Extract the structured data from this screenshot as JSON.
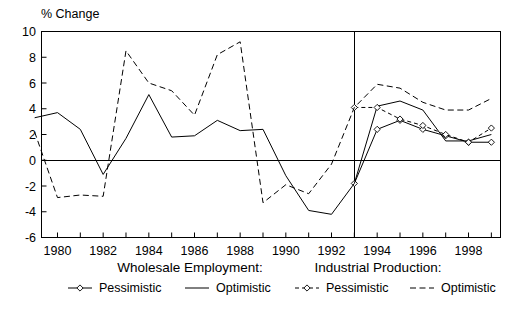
{
  "chart_data": {
    "type": "line",
    "title": "",
    "ylabel": "% Change",
    "xlabel": "",
    "ylim": [
      -6,
      10
    ],
    "xlim": [
      1979.3,
      1999.4
    ],
    "yticks": [
      -6,
      -4,
      -2,
      0,
      2,
      4,
      6,
      8,
      10
    ],
    "xticks": [
      1980,
      1982,
      1984,
      1986,
      1988,
      1990,
      1992,
      1994,
      1996,
      1998
    ],
    "xtick_labels": [
      "1980",
      "1982",
      "1984",
      "1986",
      "1988",
      "1990",
      "1992",
      "1994",
      "1996",
      "1998"
    ],
    "ytick_labels": [
      "-6",
      "-4",
      "-2",
      "0",
      "2",
      "4",
      "6",
      "8",
      "10"
    ],
    "grid": false,
    "zero_line": 0,
    "forecast_divider_x": 1993,
    "legend_position": "below",
    "series": [
      {
        "name": "Wholesale Employment: Pessimistic",
        "group": "Wholesale Employment:",
        "variant": "Pessimistic",
        "style": "solid-with-markers",
        "marker": "diamond",
        "color": "#000000",
        "x": [
          1993,
          1994,
          1995,
          1996,
          1997,
          1998,
          1999
        ],
        "values": [
          -1.8,
          2.4,
          3.1,
          2.4,
          1.9,
          1.4,
          1.4
        ]
      },
      {
        "name": "Wholesale Employment: Optimistic",
        "group": "Wholesale Employment:",
        "variant": "Optimistic",
        "style": "solid",
        "marker": "none",
        "color": "#000000",
        "x": [
          1979,
          1980,
          1981,
          1982,
          1983,
          1984,
          1985,
          1986,
          1987,
          1988,
          1989,
          1990,
          1991,
          1992,
          1993,
          1994,
          1995,
          1996,
          1997,
          1998,
          1999
        ],
        "values": [
          3.3,
          3.7,
          2.4,
          -1.1,
          1.7,
          5.1,
          1.8,
          1.9,
          3.1,
          2.3,
          2.4,
          -1.2,
          -3.9,
          -4.2,
          -1.8,
          4.2,
          4.6,
          3.9,
          1.5,
          1.5,
          2.0
        ]
      },
      {
        "name": "Industrial Production: Pessimistic",
        "group": "Industrial Production:",
        "variant": "Pessimistic",
        "style": "dashed-with-markers",
        "marker": "diamond",
        "color": "#000000",
        "x": [
          1993,
          1994,
          1995,
          1996,
          1997,
          1998,
          1999
        ],
        "values": [
          4.1,
          4.1,
          3.2,
          2.7,
          2.0,
          1.4,
          2.5
        ]
      },
      {
        "name": "Industrial Production: Optimistic",
        "group": "Industrial Production:",
        "variant": "Optimistic",
        "style": "dashed",
        "marker": "none",
        "color": "#000000",
        "x": [
          1979,
          1980,
          1981,
          1982,
          1983,
          1984,
          1985,
          1986,
          1987,
          1988,
          1989,
          1990,
          1991,
          1992,
          1993,
          1994,
          1995,
          1996,
          1997,
          1998,
          1999
        ],
        "values": [
          2.2,
          -2.9,
          -2.7,
          -2.8,
          8.5,
          6.0,
          5.4,
          3.5,
          8.2,
          9.2,
          -3.3,
          -1.9,
          -2.6,
          -0.3,
          4.1,
          5.9,
          5.6,
          4.5,
          3.9,
          3.9,
          4.8
        ]
      }
    ]
  },
  "legend": {
    "groups": [
      {
        "heading": "Wholesale Employment:",
        "items": [
          {
            "label": "Pessimistic",
            "style": "solid-with-markers"
          },
          {
            "label": "Optimistic",
            "style": "solid"
          }
        ]
      },
      {
        "heading": "Industrial Production:",
        "items": [
          {
            "label": "Pessimistic",
            "style": "dashed-with-markers"
          },
          {
            "label": "Optimistic",
            "style": "dashed"
          }
        ]
      }
    ]
  },
  "colors": {
    "ink": "#000000",
    "background": "#ffffff"
  }
}
